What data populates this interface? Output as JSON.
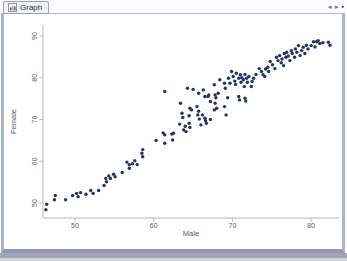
{
  "tab_bar": {
    "tab_label": "Graph",
    "nav_left_glyph": "◂",
    "nav_right_glyph": "▸",
    "close_glyph": "▪"
  },
  "window": {
    "border_color": "#adb2cd",
    "bottom_band_color": "#9399c1"
  },
  "chart_data": {
    "type": "scatter",
    "title": "",
    "xlabel": "Male",
    "ylabel": "Female",
    "xticks": [
      50,
      60,
      70,
      80
    ],
    "yticks": [
      50,
      60,
      70,
      80,
      90
    ],
    "xlim": [
      45.9,
      83.5
    ],
    "ylim": [
      46.4,
      92.6
    ],
    "grid": false,
    "legend_position": "none",
    "marker": {
      "shape": "circle",
      "color": "#223364",
      "size_px": 3
    },
    "axis_color": "#b3b7c2",
    "label_color": "#525c72",
    "points": [
      [
        46.3,
        48.4
      ],
      [
        46.4,
        49.7
      ],
      [
        47.4,
        50.8
      ],
      [
        47.5,
        51.8
      ],
      [
        48.8,
        50.8
      ],
      [
        49.7,
        51.8
      ],
      [
        50.2,
        52.3
      ],
      [
        50.4,
        51.5
      ],
      [
        50.7,
        52.5
      ],
      [
        51.4,
        52.1
      ],
      [
        52,
        53
      ],
      [
        52.3,
        52.3
      ],
      [
        53,
        53
      ],
      [
        53.7,
        54.2
      ],
      [
        53.9,
        55.9
      ],
      [
        54,
        55.1
      ],
      [
        54.3,
        56.5
      ],
      [
        54.5,
        55.9
      ],
      [
        54.9,
        56.9
      ],
      [
        55.1,
        56.3
      ],
      [
        56,
        57.3
      ],
      [
        56.6,
        59.8
      ],
      [
        56.9,
        59.2
      ],
      [
        56.9,
        58.3
      ],
      [
        57.3,
        59.4
      ],
      [
        57.6,
        60.1
      ],
      [
        57.9,
        59.2
      ],
      [
        58.5,
        61.9
      ],
      [
        58.6,
        61.1
      ],
      [
        58.6,
        62.8
      ],
      [
        60.3,
        65
      ],
      [
        61.2,
        66.8
      ],
      [
        61.4,
        64.3
      ],
      [
        61.4,
        66.3
      ],
      [
        62.3,
        66.5
      ],
      [
        62.4,
        65.1
      ],
      [
        62.5,
        66.7
      ],
      [
        63.3,
        68.9
      ],
      [
        63.8,
        67.5
      ],
      [
        64,
        68.4
      ],
      [
        64.1,
        67.1
      ],
      [
        64.5,
        69.1
      ],
      [
        64.6,
        68.1
      ],
      [
        61.4,
        76.7
      ],
      [
        63.4,
        73.9
      ],
      [
        63.6,
        71.5
      ],
      [
        63.7,
        70.5
      ],
      [
        64.3,
        77.5
      ],
      [
        64.5,
        70.9
      ],
      [
        64.6,
        72.7
      ],
      [
        64.8,
        72.3
      ],
      [
        65,
        77.2
      ],
      [
        65.5,
        73.1
      ],
      [
        65.6,
        71.1
      ],
      [
        65.7,
        76.3
      ],
      [
        65.7,
        72
      ],
      [
        65.8,
        70.1
      ],
      [
        66,
        68.7
      ],
      [
        66.2,
        71.1
      ],
      [
        66.3,
        77.1
      ],
      [
        66.5,
        75.5
      ],
      [
        66.5,
        70.3
      ],
      [
        66.6,
        69.7
      ],
      [
        66.7,
        69.1
      ],
      [
        66.9,
        75.5
      ],
      [
        67,
        75.9
      ],
      [
        67.2,
        74.3
      ],
      [
        67.2,
        70
      ],
      [
        67.7,
        78.3
      ],
      [
        67.7,
        72.3
      ],
      [
        67.8,
        75.9
      ],
      [
        67.8,
        73.9
      ],
      [
        67.9,
        75.2
      ],
      [
        68,
        72.7
      ],
      [
        68.2,
        76.3
      ],
      [
        68.4,
        79.5
      ],
      [
        69,
        78.7
      ],
      [
        69,
        73.1
      ],
      [
        69.1,
        77.5
      ],
      [
        69.2,
        71.1
      ],
      [
        69.4,
        75.2
      ],
      [
        69.5,
        79.9
      ],
      [
        69.7,
        78.7
      ],
      [
        69.9,
        81.5
      ],
      [
        70.1,
        80.3
      ],
      [
        70.3,
        79.2
      ],
      [
        70.4,
        78.4
      ],
      [
        70.5,
        81.1
      ],
      [
        70.8,
        79.9
      ],
      [
        70.8,
        75.5
      ],
      [
        70.9,
        74.7
      ],
      [
        71,
        80.7
      ],
      [
        71.1,
        78.9
      ],
      [
        71.2,
        80
      ],
      [
        71.4,
        79.5
      ],
      [
        71.5,
        77.9
      ],
      [
        71.6,
        80.8
      ],
      [
        71.6,
        75.1
      ],
      [
        71.7,
        74.4
      ],
      [
        71.8,
        79.9
      ],
      [
        71.9,
        78.9
      ],
      [
        72.1,
        80.3
      ],
      [
        72.4,
        77.9
      ],
      [
        72.5,
        79.1
      ],
      [
        72.7,
        79.9
      ],
      [
        73,
        80.8
      ],
      [
        73.4,
        82.2
      ],
      [
        73.7,
        81.5
      ],
      [
        73.9,
        80.7
      ],
      [
        74.1,
        80.3
      ],
      [
        74.2,
        82.1
      ],
      [
        74.5,
        82.5
      ],
      [
        74.6,
        81.5
      ],
      [
        74.8,
        83.9
      ],
      [
        75.1,
        83.1
      ],
      [
        75.4,
        82.2
      ],
      [
        75.6,
        84.9
      ],
      [
        75.8,
        84.1
      ],
      [
        76,
        85.3
      ],
      [
        76.2,
        83.6
      ],
      [
        76.3,
        84.5
      ],
      [
        76.5,
        82.9
      ],
      [
        76.6,
        85.8
      ],
      [
        76.8,
        84.9
      ],
      [
        76.9,
        86.1
      ],
      [
        77.1,
        85.2
      ],
      [
        77.3,
        84.1
      ],
      [
        77.5,
        86.5
      ],
      [
        77.6,
        85.8
      ],
      [
        77.9,
        84.9
      ],
      [
        78,
        86.9
      ],
      [
        78.2,
        86.1
      ],
      [
        78.4,
        87.7
      ],
      [
        78.6,
        85.3
      ],
      [
        78.8,
        86.5
      ],
      [
        79,
        87.3
      ],
      [
        79.2,
        85.8
      ],
      [
        79.4,
        87.8
      ],
      [
        79.6,
        86.9
      ],
      [
        80,
        87.7
      ],
      [
        80.3,
        88.6
      ],
      [
        80.5,
        87.4
      ],
      [
        80.7,
        88.6
      ],
      [
        80.9,
        88.9
      ],
      [
        81.1,
        88.2
      ],
      [
        81.5,
        88.4
      ],
      [
        82.2,
        88.5
      ],
      [
        82.4,
        87.8
      ]
    ]
  }
}
